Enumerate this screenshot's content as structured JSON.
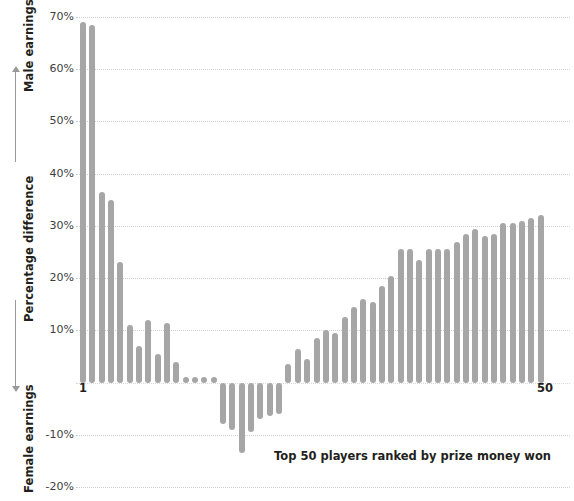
{
  "chart_data": {
    "type": "bar",
    "title": "",
    "xlabel": "Top 50 players ranked by prize money won",
    "ylabel": "Percentage difference",
    "ylabel_top": "Male earnings",
    "ylabel_bottom": "Female earnings",
    "ylim": [
      -20,
      72
    ],
    "grid": true,
    "grid_style": "dotted-horizontal",
    "legend": "none",
    "bar_color": "#a6a6a6",
    "background_color": "#ffffff",
    "text_color": "#231f20",
    "gridline_color": "#d0d0d0",
    "ytick_labels": [
      "70%",
      "60%",
      "50%",
      "40%",
      "30%",
      "20%",
      "10%",
      "-10%",
      "-20%"
    ],
    "ytick_values": [
      70,
      60,
      50,
      40,
      30,
      20,
      10,
      -10,
      -20
    ],
    "gridline_values": [
      70,
      60,
      50,
      40,
      30,
      20,
      10,
      0,
      -10,
      -20
    ],
    "xtick_labels": [
      "1",
      "50"
    ],
    "xtick_positions": [
      1,
      50
    ],
    "categories": [
      1,
      2,
      3,
      4,
      5,
      6,
      7,
      8,
      9,
      10,
      11,
      12,
      13,
      14,
      15,
      16,
      17,
      18,
      19,
      20,
      21,
      22,
      23,
      24,
      25,
      26,
      27,
      28,
      29,
      30,
      31,
      32,
      33,
      34,
      35,
      36,
      37,
      38,
      39,
      40,
      41,
      42,
      43,
      44,
      45,
      46,
      47,
      48,
      49,
      50
    ],
    "values": [
      69.0,
      68.5,
      36.5,
      35.0,
      23.0,
      11.0,
      7.0,
      12.0,
      5.5,
      11.5,
      4.0,
      1.0,
      1.0,
      1.0,
      1.0,
      -8.0,
      -9.0,
      -13.5,
      -9.5,
      -7.0,
      -6.5,
      -6.0,
      3.5,
      6.5,
      4.5,
      8.5,
      10.0,
      9.5,
      12.5,
      14.5,
      16.0,
      15.5,
      18.5,
      20.5,
      25.5,
      25.5,
      23.5,
      25.5,
      25.5,
      25.5,
      27.0,
      28.5,
      29.5,
      28.0,
      28.5,
      30.5,
      30.5,
      31.0,
      31.5,
      32.0
    ]
  },
  "axis": {
    "male_earnings": "Male earnings",
    "female_earnings": "Female earnings",
    "percentage_difference": "Percentage difference",
    "x_title": "Top 50 players ranked by prize money won",
    "x_first": "1",
    "x_last": "50"
  }
}
